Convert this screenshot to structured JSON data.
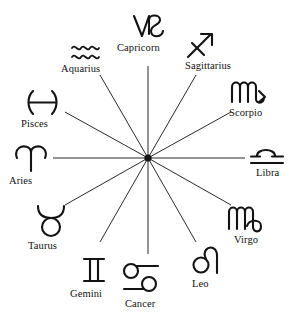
{
  "figure": {
    "center": {
      "x": 148,
      "y": 158
    },
    "spoke_count": 12,
    "spoke_angle_step_deg": 30,
    "line_color": "#2b2b2b",
    "glyph_color": "#131313",
    "background": "#ffffff"
  },
  "chart_data": {
    "type": "scatter",
    "xlabel": "",
    "ylabel": "",
    "grid": false,
    "legend": "none",
    "categories": [
      "Capricorn",
      "Sagittarius",
      "Scorpio",
      "Libra",
      "Virgo",
      "Leo",
      "Cancer",
      "Gemini",
      "Taurus",
      "Aries",
      "Pisces",
      "Aquarius"
    ],
    "values": [
      90,
      60,
      30,
      0,
      330,
      300,
      270,
      240,
      210,
      180,
      150,
      120
    ]
  },
  "signs": [
    {
      "name": "Capricorn",
      "glyph": "capricorn-glyph",
      "unicode": "♑",
      "angle_deg": 90,
      "label_x": 117,
      "label_y": 42,
      "glyph_x": 130,
      "glyph_y": 12,
      "spoke_end_x": 148,
      "spoke_end_y": 66
    },
    {
      "name": "Sagittarius",
      "glyph": "sagittarius-glyph",
      "unicode": "♐",
      "angle_deg": 60,
      "label_x": 185,
      "label_y": 60,
      "glyph_x": 186,
      "glyph_y": 30,
      "spoke_end_x": 196,
      "spoke_end_y": 75
    },
    {
      "name": "Scorpio",
      "glyph": "scorpio-glyph",
      "unicode": "♏",
      "angle_deg": 30,
      "label_x": 229,
      "label_y": 107,
      "glyph_x": 230,
      "glyph_y": 78,
      "spoke_end_x": 231,
      "spoke_end_y": 112
    },
    {
      "name": "Libra",
      "glyph": "libra-glyph",
      "unicode": "♎",
      "angle_deg": 0,
      "label_x": 256,
      "label_y": 167,
      "glyph_x": 249,
      "glyph_y": 145,
      "spoke_end_x": 245,
      "spoke_end_y": 158
    },
    {
      "name": "Virgo",
      "glyph": "virgo-glyph",
      "unicode": "♍",
      "angle_deg": 330,
      "label_x": 234,
      "label_y": 234,
      "glyph_x": 227,
      "glyph_y": 203,
      "spoke_end_x": 231,
      "spoke_end_y": 205
    },
    {
      "name": "Leo",
      "glyph": "leo-glyph",
      "unicode": "♌",
      "label_x": 192,
      "label_y": 278,
      "angle_deg": 300,
      "glyph_x": 192,
      "glyph_y": 245,
      "spoke_end_x": 196,
      "spoke_end_y": 242
    },
    {
      "name": "Cancer",
      "glyph": "cancer-glyph",
      "unicode": "♋",
      "angle_deg": 270,
      "label_x": 125,
      "label_y": 298,
      "glyph_x": 122,
      "glyph_y": 262,
      "spoke_end_x": 148,
      "spoke_end_y": 254
    },
    {
      "name": "Gemini",
      "glyph": "gemini-glyph",
      "unicode": "♊",
      "angle_deg": 240,
      "label_x": 70,
      "label_y": 288,
      "glyph_x": 80,
      "glyph_y": 256,
      "spoke_end_x": 100,
      "spoke_end_y": 242
    },
    {
      "name": "Taurus",
      "glyph": "taurus-glyph",
      "unicode": "♉",
      "angle_deg": 210,
      "label_x": 28,
      "label_y": 240,
      "glyph_x": 35,
      "glyph_y": 203,
      "spoke_end_x": 65,
      "spoke_end_y": 205
    },
    {
      "name": "Aries",
      "glyph": "aries-glyph",
      "unicode": "♈",
      "angle_deg": 180,
      "label_x": 9,
      "label_y": 175,
      "glyph_x": 13,
      "glyph_y": 143,
      "spoke_end_x": 53,
      "spoke_end_y": 158
    },
    {
      "name": "Pisces",
      "glyph": "pisces-glyph",
      "unicode": "♓",
      "angle_deg": 150,
      "label_x": 21,
      "label_y": 118,
      "glyph_x": 26,
      "glyph_y": 89,
      "spoke_end_x": 65,
      "spoke_end_y": 112
    },
    {
      "name": "Aquarius",
      "glyph": "aquarius-glyph",
      "unicode": "♒",
      "angle_deg": 120,
      "label_x": 61,
      "label_y": 63,
      "glyph_x": 70,
      "glyph_y": 41,
      "spoke_end_x": 100,
      "spoke_end_y": 75
    }
  ]
}
